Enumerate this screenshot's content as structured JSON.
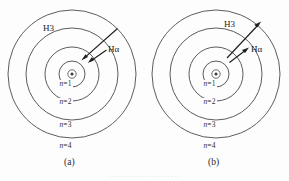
{
  "figure": {
    "kind": "bohr-model-transition-diagram",
    "background_color": "#fdfdfd",
    "line_color": "#4a4a4a",
    "arrow_color": "#1e1e1e",
    "panels": [
      {
        "id": "a",
        "caption": "(a)",
        "process": "emission",
        "nucleus_symbol": "⊙",
        "orbit_labels": [
          {
            "text": "n",
            "eq": "=",
            "num": "1"
          },
          {
            "text": "n",
            "eq": "=",
            "num": "2"
          },
          {
            "text": "n",
            "eq": "=",
            "num": "3"
          },
          {
            "text": "n",
            "eq": "=",
            "num": "4"
          }
        ],
        "transitions": [
          {
            "label": "H3",
            "from_orbit": 4,
            "to_orbit": 2,
            "direction": "inward"
          },
          {
            "label": "Hα",
            "from_orbit": 3,
            "to_orbit": 2,
            "direction": "inward"
          }
        ]
      },
      {
        "id": "b",
        "caption": "(b)",
        "process": "absorption",
        "nucleus_symbol": "⊙",
        "orbit_labels": [
          {
            "text": "n",
            "eq": "=",
            "num": "1"
          },
          {
            "text": "n",
            "eq": "=",
            "num": "2"
          },
          {
            "text": "n",
            "eq": "=",
            "num": "3"
          },
          {
            "text": "n",
            "eq": "=",
            "num": "4"
          }
        ],
        "transitions": [
          {
            "label": "H3",
            "from_orbit": 2,
            "to_orbit": 4,
            "direction": "outward"
          },
          {
            "label": "Hα",
            "from_orbit": 2,
            "to_orbit": 3,
            "direction": "outward"
          }
        ]
      }
    ]
  },
  "footer": {
    "cropped_caption_text": "······················"
  }
}
